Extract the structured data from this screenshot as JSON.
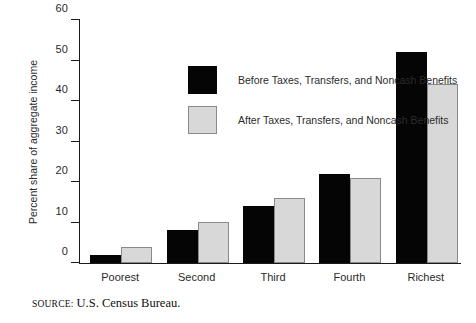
{
  "chart_data": {
    "type": "bar",
    "title": "",
    "subtitle": "",
    "xlabel": "",
    "ylabel": "Percent share of aggregate income",
    "ylim": [
      0,
      60
    ],
    "yticks": [
      0,
      10,
      20,
      30,
      40,
      50,
      60
    ],
    "grid": false,
    "legend_position": "upper-left-inside",
    "categories": [
      "Poorest",
      "Second",
      "Third",
      "Fourth",
      "Richest"
    ],
    "series": [
      {
        "name": "Before Taxes, Transfers, and Noncash Benefits",
        "color": "#050505",
        "values": [
          2,
          8,
          14,
          22,
          52
        ]
      },
      {
        "name": "After Taxes, Transfers, and Noncash Benefits",
        "color": "#d8d8d8",
        "values": [
          4,
          10,
          16,
          21,
          44
        ]
      }
    ],
    "annotations": [
      "SOURCE: U.S. Census Bureau."
    ]
  },
  "axis": {
    "y_title": "Percent share of aggregate income",
    "y_tick_labels": [
      "0",
      "10",
      "20",
      "30",
      "40",
      "50",
      "60"
    ],
    "x_tick_labels": [
      "Poorest",
      "Second",
      "Third",
      "Fourth",
      "Richest"
    ]
  },
  "legend": {
    "items": [
      {
        "label": "Before Taxes, Transfers, and Noncash Benefits",
        "swatch": "black-square"
      },
      {
        "label": "After Taxes, Transfers, and Noncash Benefits",
        "swatch": "gray-square"
      }
    ]
  },
  "source": {
    "label": "SOURCE:",
    "value": "U.S. Census Bureau."
  }
}
